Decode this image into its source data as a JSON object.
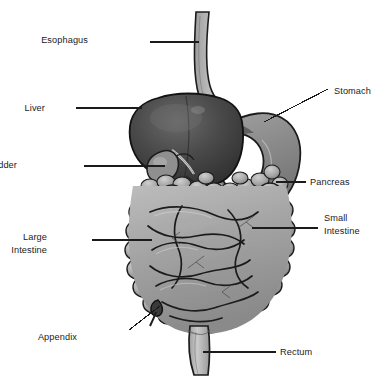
{
  "figure": {
    "background_color": "#ffffff",
    "width": 388,
    "height": 383,
    "style": "grayscale shaded medical illustration with leader-line callouts"
  },
  "labels": [
    {
      "id": "esophagus",
      "text": "Esophagus",
      "side": "left",
      "x": 88,
      "y": 34,
      "lines": [
        "Esophagus"
      ]
    },
    {
      "id": "liver",
      "text": "Liver",
      "side": "left",
      "x": 45,
      "y": 102,
      "lines": [
        "Liver"
      ]
    },
    {
      "id": "gallbladder",
      "text": "Gallbladder",
      "side": "left",
      "x": 17,
      "y": 159,
      "lines": [
        "Gallbladder"
      ]
    },
    {
      "id": "large-intestine",
      "text": "Large Intestine",
      "side": "left",
      "x": 47,
      "y": 231,
      "lines": [
        "Large",
        "Intestine"
      ]
    },
    {
      "id": "appendix",
      "text": "Appendix",
      "side": "left",
      "x": 77,
      "y": 331,
      "lines": [
        "Appendix"
      ]
    },
    {
      "id": "stomach",
      "text": "Stomach",
      "side": "right",
      "x": 334,
      "y": 85,
      "lines": [
        "Stomach"
      ]
    },
    {
      "id": "pancreas",
      "text": "Pancreas",
      "side": "right",
      "x": 310,
      "y": 176,
      "lines": [
        "Pancreas"
      ]
    },
    {
      "id": "small-intestine",
      "text": "Small Intestine",
      "side": "right",
      "x": 324,
      "y": 212,
      "lines": [
        "Small",
        "Intestine"
      ]
    },
    {
      "id": "rectum",
      "text": "Rectum",
      "side": "right",
      "x": 280,
      "y": 346,
      "lines": [
        "Rectum"
      ]
    }
  ],
  "leader_lines": [
    {
      "id": "esophagus",
      "x1": 150,
      "y1": 42,
      "x2": 199,
      "y2": 42
    },
    {
      "id": "liver",
      "x1": 76,
      "y1": 108,
      "x2": 142,
      "y2": 108
    },
    {
      "id": "gallbladder",
      "x1": 84,
      "y1": 166,
      "x2": 165,
      "y2": 166
    },
    {
      "id": "large-intestine",
      "x1": 92,
      "y1": 240,
      "x2": 152,
      "y2": 240
    },
    {
      "id": "appendix",
      "x1": 129,
      "y1": 330,
      "x2": 160,
      "y2": 306
    },
    {
      "id": "stomach",
      "x1": 328,
      "y1": 89,
      "x2": 264,
      "y2": 122
    },
    {
      "id": "pancreas",
      "x1": 306,
      "y1": 182,
      "x2": 276,
      "y2": 182
    },
    {
      "id": "small-intestine",
      "x1": 318,
      "y1": 228,
      "x2": 252,
      "y2": 228
    },
    {
      "id": "rectum",
      "x1": 276,
      "y1": 352,
      "x2": 203,
      "y2": 352
    }
  ],
  "organs": [
    {
      "id": "esophagus",
      "name": "Esophagus",
      "tone": "light-gray tube",
      "color": "#b7b7b7"
    },
    {
      "id": "stomach",
      "name": "Stomach",
      "tone": "mid-gray J-shaped sac",
      "color": "#8e8e8e"
    },
    {
      "id": "liver",
      "name": "Liver",
      "tone": "dark gray lobed mass",
      "color": "#414141"
    },
    {
      "id": "gallbladder",
      "name": "Gallbladder",
      "tone": "mid-gray pear",
      "color": "#8a8a8a"
    },
    {
      "id": "pancreas",
      "name": "Pancreas",
      "tone": "light gray lobulated gland",
      "color": "#a8a8a8"
    },
    {
      "id": "small-intestine",
      "name": "Small Intestine",
      "tone": "coiled mid-gray loops",
      "color": "#9a9a9a"
    },
    {
      "id": "large-intestine",
      "name": "Large Intestine",
      "tone": "haustrated frame",
      "color": "#b0b0b0"
    },
    {
      "id": "appendix",
      "name": "Appendix",
      "tone": "small dark nub",
      "color": "#3a3a3a"
    },
    {
      "id": "rectum",
      "name": "Rectum",
      "tone": "light gray tapering tube",
      "color": "#c0c0c0"
    }
  ],
  "palette": {
    "outline": "#1c1c1c",
    "liver_dark": "#3c3c3c",
    "liver_mid": "#575757",
    "stomach_mid": "#8d8d8d",
    "stomach_light": "#a9a9a9",
    "intestine_light": "#bcbcbc",
    "intestine_mid": "#9d9d9d",
    "intestine_shadow": "#7a7a7a",
    "esophagus": "#b5b5b5",
    "text": "#1b1b1b",
    "background": "#ffffff"
  }
}
